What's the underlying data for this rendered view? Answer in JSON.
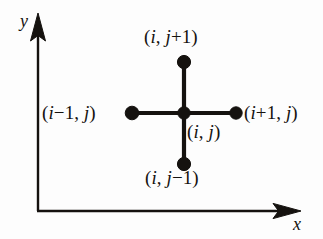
{
  "figure": {
    "background_color": "#fdfdfd",
    "ink_color": "#15120f"
  },
  "axes": {
    "x_label": "x",
    "y_label": "y",
    "origin": {
      "x": 38,
      "y": 211
    },
    "x_end": {
      "x": 300,
      "y": 211
    },
    "y_end": {
      "x": 38,
      "y": 14
    },
    "arrowheads": [
      "x-axis-arrow",
      "y-axis-arrow"
    ]
  },
  "stencil": {
    "center": {
      "x": 184,
      "y": 113
    },
    "arm_length_px": 52,
    "node_radius_px": 6.5,
    "stroke_width_px": 4.2,
    "nodes": [
      {
        "id": "node-center",
        "label_parts": [
          {
            "text": "(",
            "style": "upright"
          },
          {
            "text": "i",
            "style": "italic"
          },
          {
            "text": ", ",
            "style": "upright"
          },
          {
            "text": "j",
            "style": "italic"
          },
          {
            "text": ")",
            "style": "upright"
          }
        ],
        "label_text": "(i, j)",
        "cx": 184,
        "cy": 113
      },
      {
        "id": "node-north",
        "label_parts": [
          {
            "text": "(",
            "style": "upright"
          },
          {
            "text": "i",
            "style": "italic"
          },
          {
            "text": ", ",
            "style": "upright"
          },
          {
            "text": "j",
            "style": "italic"
          },
          {
            "text": "+1)",
            "style": "upright"
          }
        ],
        "label_text": "(i, j+1)",
        "cx": 184,
        "cy": 62
      },
      {
        "id": "node-south",
        "label_parts": [
          {
            "text": "(",
            "style": "upright"
          },
          {
            "text": "i",
            "style": "italic"
          },
          {
            "text": ", ",
            "style": "upright"
          },
          {
            "text": "j",
            "style": "italic"
          },
          {
            "text": "−1)",
            "style": "upright"
          }
        ],
        "label_text": "(i, j−1)",
        "cx": 184,
        "cy": 164
      },
      {
        "id": "node-west",
        "label_parts": [
          {
            "text": "(",
            "style": "upright"
          },
          {
            "text": "i",
            "style": "italic"
          },
          {
            "text": "−1, ",
            "style": "upright"
          },
          {
            "text": "j",
            "style": "italic"
          },
          {
            "text": ")",
            "style": "upright"
          }
        ],
        "label_text": "(i−1, j)",
        "cx": 132,
        "cy": 113
      },
      {
        "id": "node-east",
        "label_parts": [
          {
            "text": "(",
            "style": "upright"
          },
          {
            "text": "i",
            "style": "italic"
          },
          {
            "text": "+1, ",
            "style": "upright"
          },
          {
            "text": "j",
            "style": "italic"
          },
          {
            "text": ")",
            "style": "upright"
          }
        ],
        "label_text": "(i+1, j)",
        "cx": 236,
        "cy": 113
      }
    ]
  }
}
